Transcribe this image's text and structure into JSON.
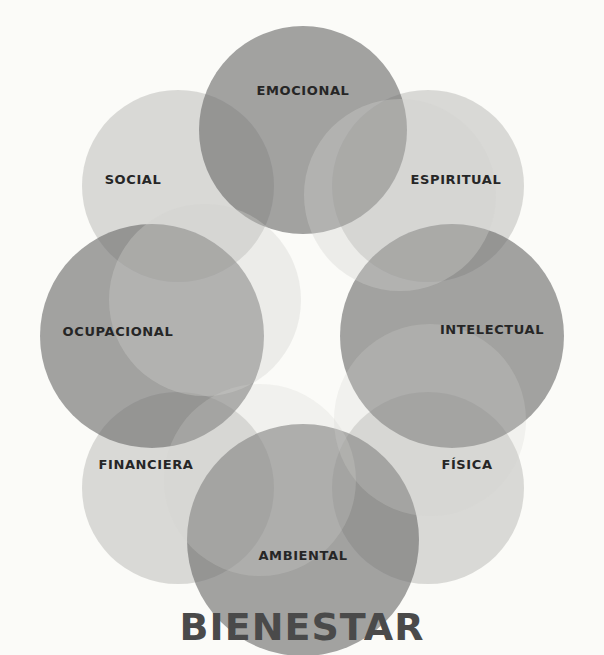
{
  "diagram": {
    "title": "BIENESTAR",
    "colors": {
      "background": "#fbfbf8",
      "dark_circle": "#6f6f6f",
      "light_circle": "#c9c9c6",
      "label": "#262626",
      "title": "#4a4a4a"
    },
    "dimensions": [
      {
        "label": "EMOCIONAL",
        "tone": "dark"
      },
      {
        "label": "ESPIRITUAL",
        "tone": "light"
      },
      {
        "label": "INTELECTUAL",
        "tone": "dark"
      },
      {
        "label": "FÍSICA",
        "tone": "light"
      },
      {
        "label": "AMBIENTAL",
        "tone": "dark"
      },
      {
        "label": "FINANCIERA",
        "tone": "light"
      },
      {
        "label": "OCUPACIONAL",
        "tone": "dark"
      },
      {
        "label": "SOCIAL",
        "tone": "light"
      }
    ]
  }
}
